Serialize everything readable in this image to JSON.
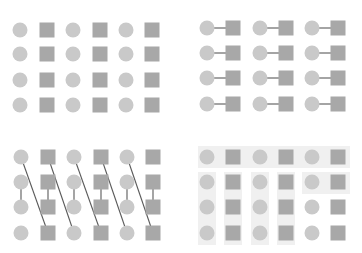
{
  "colors": {
    "background": "#ffffff",
    "circle": "#c9c9c9",
    "square": "#a8a8a8",
    "line": "#5a5a5a",
    "group_band": "#f0f0f0"
  },
  "shape_size": {
    "circle_r": 7.5,
    "square": 15
  },
  "panels": [
    {
      "id": "ungrouped",
      "columns": [
        {
          "type": "circle",
          "x": 20
        },
        {
          "type": "square",
          "x": 47
        },
        {
          "type": "circle",
          "x": 73
        },
        {
          "type": "square",
          "x": 100
        },
        {
          "type": "circle",
          "x": 126
        },
        {
          "type": "square",
          "x": 152
        }
      ],
      "rows": [
        30,
        54,
        80,
        105
      ],
      "links": [],
      "bands": []
    },
    {
      "id": "pair-connected",
      "columns": [
        {
          "type": "circle",
          "x": 207
        },
        {
          "type": "square",
          "x": 233
        },
        {
          "type": "circle",
          "x": 260
        },
        {
          "type": "square",
          "x": 286
        },
        {
          "type": "circle",
          "x": 312
        },
        {
          "type": "square",
          "x": 338
        }
      ],
      "rows": [
        28,
        53,
        78,
        104
      ],
      "links": [
        {
          "from": [
            0,
            0
          ],
          "to": [
            0,
            1
          ]
        },
        {
          "from": [
            0,
            2
          ],
          "to": [
            0,
            3
          ]
        },
        {
          "from": [
            0,
            4
          ],
          "to": [
            0,
            5
          ]
        },
        {
          "from": [
            1,
            0
          ],
          "to": [
            1,
            1
          ]
        },
        {
          "from": [
            1,
            2
          ],
          "to": [
            1,
            3
          ]
        },
        {
          "from": [
            1,
            4
          ],
          "to": [
            1,
            5
          ]
        },
        {
          "from": [
            2,
            0
          ],
          "to": [
            2,
            1
          ]
        },
        {
          "from": [
            2,
            2
          ],
          "to": [
            2,
            3
          ]
        },
        {
          "from": [
            2,
            4
          ],
          "to": [
            2,
            5
          ]
        },
        {
          "from": [
            3,
            0
          ],
          "to": [
            3,
            1
          ]
        },
        {
          "from": [
            3,
            2
          ],
          "to": [
            3,
            3
          ]
        },
        {
          "from": [
            3,
            4
          ],
          "to": [
            3,
            5
          ]
        }
      ],
      "bands": []
    },
    {
      "id": "diagonal-connected",
      "columns": [
        {
          "type": "circle",
          "x": 21
        },
        {
          "type": "square",
          "x": 48
        },
        {
          "type": "circle",
          "x": 74
        },
        {
          "type": "square",
          "x": 101
        },
        {
          "type": "circle",
          "x": 127
        },
        {
          "type": "square",
          "x": 153
        }
      ],
      "rows": [
        157,
        182,
        207,
        233
      ],
      "links": [
        {
          "from": [
            0,
            0
          ],
          "to": [
            3,
            1
          ]
        },
        {
          "from": [
            0,
            1
          ],
          "to": [
            3,
            2
          ]
        },
        {
          "from": [
            0,
            2
          ],
          "to": [
            3,
            3
          ]
        },
        {
          "from": [
            0,
            3
          ],
          "to": [
            3,
            4
          ]
        },
        {
          "from": [
            0,
            4
          ],
          "to": [
            3,
            5
          ]
        },
        {
          "from": [
            1,
            0
          ],
          "to": [
            2,
            0
          ]
        },
        {
          "from": [
            1,
            1
          ],
          "to": [
            2,
            1
          ]
        },
        {
          "from": [
            1,
            2
          ],
          "to": [
            2,
            2
          ]
        },
        {
          "from": [
            1,
            3
          ],
          "to": [
            2,
            3
          ]
        },
        {
          "from": [
            1,
            4
          ],
          "to": [
            2,
            4
          ]
        },
        {
          "from": [
            1,
            5
          ],
          "to": [
            2,
            5
          ]
        }
      ],
      "bands": []
    },
    {
      "id": "region-grouped",
      "columns": [
        {
          "type": "circle",
          "x": 207
        },
        {
          "type": "square",
          "x": 233
        },
        {
          "type": "circle",
          "x": 260
        },
        {
          "type": "square",
          "x": 286
        },
        {
          "type": "circle",
          "x": 312
        },
        {
          "type": "square",
          "x": 338
        }
      ],
      "rows": [
        157,
        182,
        207,
        233
      ],
      "links": [],
      "bands": [
        {
          "x": 198,
          "y": 146,
          "w": 152,
          "h": 22
        },
        {
          "x": 198,
          "y": 172,
          "w": 18,
          "h": 73
        },
        {
          "x": 224,
          "y": 172,
          "w": 18,
          "h": 73
        },
        {
          "x": 251,
          "y": 172,
          "w": 18,
          "h": 73
        },
        {
          "x": 277,
          "y": 172,
          "w": 18,
          "h": 73
        },
        {
          "x": 302,
          "y": 172,
          "w": 48,
          "h": 22
        }
      ]
    }
  ]
}
